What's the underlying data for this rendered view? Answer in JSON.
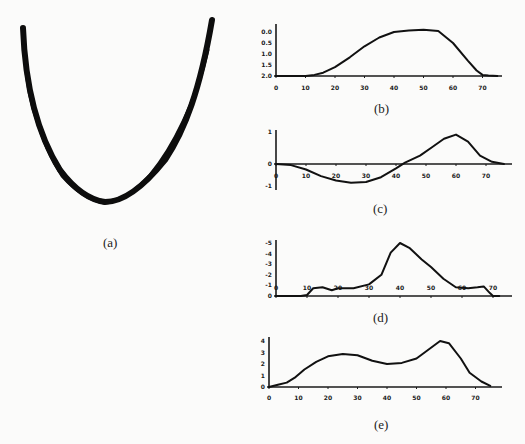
{
  "figure": {
    "panels": [
      "(a)",
      "(b)",
      "(c)",
      "(d)",
      "(e)"
    ]
  },
  "chart_data": [
    {
      "panel": "(a)",
      "type": "line",
      "title": "(a)",
      "description": "U-shaped overlaid trajectory traces (no axes)"
    },
    {
      "panel": "(b)",
      "type": "line",
      "title": "(b)",
      "xlabel": "",
      "ylabel": "",
      "xticks": [
        "0",
        "10",
        "20",
        "30",
        "40",
        "50",
        "60",
        "70"
      ],
      "yticks": [
        "0.0",
        "0.5",
        "1.0",
        "1.5",
        "2.0"
      ],
      "xlim": [
        0,
        78
      ],
      "ylim": [
        0,
        2.2
      ],
      "x": [
        0,
        5,
        10,
        13,
        16,
        20,
        25,
        30,
        35,
        40,
        45,
        50,
        55,
        60,
        65,
        68,
        70,
        72,
        75
      ],
      "values": [
        0,
        0,
        0,
        0.05,
        0.15,
        0.4,
        0.85,
        1.35,
        1.75,
        2.0,
        2.07,
        2.1,
        2.05,
        1.5,
        0.7,
        0.25,
        0.05,
        0.02,
        0
      ]
    },
    {
      "panel": "(c)",
      "type": "line",
      "title": "(c)",
      "xlabel": "",
      "ylabel": "",
      "xticks": [
        "0",
        "10",
        "20",
        "30",
        "40",
        "50",
        "60",
        "70"
      ],
      "yticks": [
        "1",
        "0",
        "-1"
      ],
      "xlim": [
        0,
        78
      ],
      "ylim": [
        -1,
        1.2
      ],
      "x": [
        0,
        5,
        10,
        15,
        20,
        25,
        30,
        35,
        40,
        43,
        48,
        52,
        56,
        60,
        64,
        68,
        72,
        76
      ],
      "values": [
        0,
        -0.05,
        -0.25,
        -0.55,
        -0.75,
        -0.85,
        -0.82,
        -0.6,
        -0.2,
        0.05,
        0.3,
        0.6,
        0.9,
        1.05,
        0.8,
        0.3,
        0.08,
        0
      ]
    },
    {
      "panel": "(d)",
      "type": "line",
      "title": "(d)",
      "xlabel": "",
      "ylabel": "",
      "xticks": [
        "0",
        "10",
        "20",
        "30",
        "40",
        "50",
        "60",
        "70"
      ],
      "yticks": [
        "-5",
        "-4",
        "-3",
        "-2",
        "-1",
        "0"
      ],
      "xlim": [
        0,
        78
      ],
      "ylim": [
        0,
        6
      ],
      "x": [
        0,
        8,
        10,
        12,
        15,
        18,
        20,
        25,
        30,
        34,
        37,
        40,
        43,
        47,
        50,
        54,
        58,
        62,
        65,
        67,
        69,
        70,
        72
      ],
      "values": [
        0,
        0,
        0.1,
        0.8,
        0.9,
        0.6,
        0.8,
        0.8,
        1.2,
        2.2,
        4.5,
        5.5,
        5.0,
        3.8,
        3.0,
        1.8,
        0.9,
        0.8,
        0.9,
        1.0,
        0.3,
        0,
        0
      ]
    },
    {
      "panel": "(e)",
      "type": "line",
      "title": "(e)",
      "xlabel": "",
      "ylabel": "",
      "xticks": [
        "0",
        "10",
        "20",
        "30",
        "40",
        "50",
        "60",
        "70"
      ],
      "yticks": [
        "0",
        "1",
        "2",
        "3",
        "4"
      ],
      "xlim": [
        0,
        78
      ],
      "ylim": [
        0,
        4.5
      ],
      "x": [
        0,
        3,
        6,
        9,
        12,
        16,
        20,
        25,
        30,
        35,
        40,
        45,
        50,
        54,
        58,
        61,
        65,
        68,
        72,
        75
      ],
      "values": [
        0,
        0.2,
        0.4,
        0.9,
        1.6,
        2.3,
        2.8,
        3.0,
        2.9,
        2.4,
        2.1,
        2.2,
        2.6,
        3.4,
        4.2,
        4.0,
        2.6,
        1.3,
        0.5,
        0.1
      ]
    }
  ]
}
